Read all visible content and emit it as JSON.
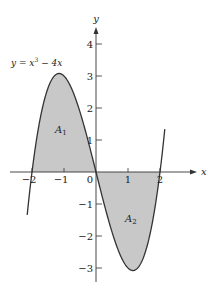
{
  "chart_data": {
    "type": "area",
    "title": "",
    "function_label": "y = x^3 − 4x",
    "function_label_parts": {
      "base": "y = x",
      "exp": "3",
      "rest": " − 4x"
    },
    "xlabel": "x",
    "ylabel": "y",
    "xlim": [
      -2.6,
      3.1
    ],
    "ylim": [
      -3.4,
      4.5
    ],
    "x_ticks": [
      -2,
      -1,
      0,
      1,
      2
    ],
    "x_tick_labels": [
      "−2",
      "−1",
      "0",
      "1",
      "2"
    ],
    "y_ticks": [
      4,
      3,
      2,
      1,
      -1,
      -2,
      -3
    ],
    "y_tick_labels": [
      "4",
      "3",
      "2",
      "1",
      "−1",
      "−2",
      "−3"
    ],
    "grid": false,
    "series": [
      {
        "name": "y = x^3 − 4x",
        "x": [
          -2,
          -1.5,
          -1.155,
          -1,
          -0.5,
          0,
          0.5,
          1,
          1.155,
          1.5,
          2
        ],
        "y": [
          0,
          2.625,
          3.08,
          3,
          1.875,
          0,
          -1.875,
          -3,
          -3.08,
          -2.625,
          0
        ]
      }
    ],
    "regions": [
      {
        "name": "A_1",
        "label": "A",
        "sub": "1",
        "x_range": [
          -2,
          0
        ],
        "fill": "#c8c8c8"
      },
      {
        "name": "A_2",
        "label": "A",
        "sub": "2",
        "x_range": [
          0,
          2
        ],
        "fill": "#c8c8c8"
      }
    ],
    "colors": {
      "fill": "#c8c8c8",
      "stroke": "#333333"
    }
  }
}
